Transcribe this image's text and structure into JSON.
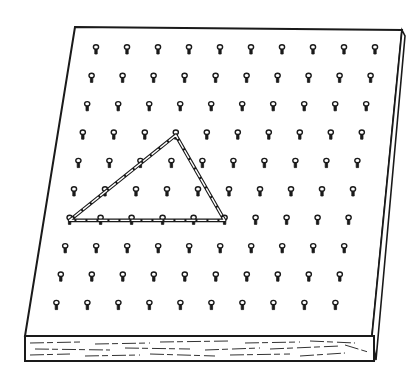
{
  "figure": {
    "title": "Geoboard with rubber band triangle",
    "subject": "geoboard",
    "grid": {
      "rows": 10,
      "cols": 10
    },
    "shape": {
      "type": "triangle",
      "vertices": [
        {
          "row": 3,
          "col": 3,
          "label": "apex"
        },
        {
          "row": 6,
          "col": 0,
          "label": "base-left"
        },
        {
          "row": 6,
          "col": 5,
          "label": "base-right"
        }
      ]
    },
    "colors": {
      "ink": "#1a1a1a",
      "paper": "#ffffff"
    }
  }
}
